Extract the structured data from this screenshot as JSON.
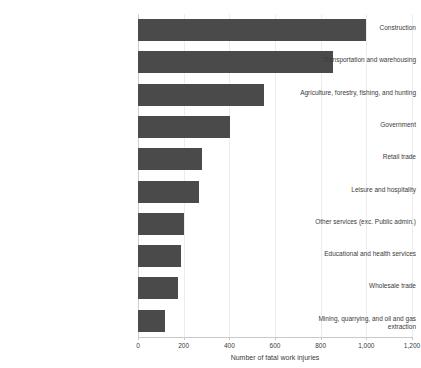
{
  "chart_data": {
    "type": "bar",
    "orientation": "horizontal",
    "title": "",
    "subtitle": "",
    "xlabel": "Number of fatal work injuries",
    "ylabel": "",
    "xlim": [
      0,
      1200
    ],
    "xticks": [
      "0",
      "200",
      "400",
      "600",
      "800",
      "1,000",
      "1,200"
    ],
    "xtick_values": [
      0,
      200,
      400,
      600,
      800,
      1000,
      1200
    ],
    "grid": true,
    "grid_axis": "x",
    "legend": null,
    "legend_position": "none",
    "bar_color": "#4a4a4a",
    "categories": [
      "Construction",
      "Transportation and warehousing",
      "Agriculture, forestry, fishing, and hunting",
      "Government",
      "Retail trade",
      "Leisure and hospitality",
      "Other services (exc. Public admin.)",
      "Educational and health services",
      "Wholesale trade",
      "Mining, quarrying, and oil and gas extraction"
    ],
    "values": [
      1000,
      855,
      550,
      405,
      280,
      265,
      200,
      190,
      175,
      120
    ]
  }
}
